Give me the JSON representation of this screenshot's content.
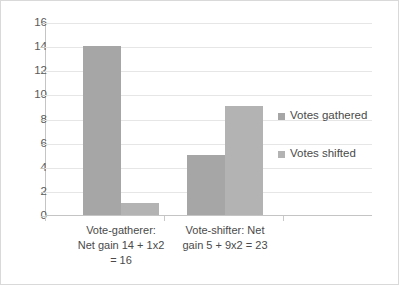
{
  "chart_data": {
    "type": "bar",
    "title": "",
    "subtitle": "",
    "xlabel": "",
    "ylabel": "",
    "ylim": [
      0,
      16
    ],
    "ytick_step": 2,
    "yticks": [
      0,
      2,
      4,
      6,
      8,
      10,
      12,
      14,
      16
    ],
    "grid": true,
    "grid_axis": "y",
    "legend_position": "right",
    "categories": [
      "Vote-gatherer:\nNet gain 14 + 1x2\n= 16",
      "Vote-shifter: Net\ngain 5 + 9x2 = 23"
    ],
    "series": [
      {
        "name": "Votes gathered",
        "values": [
          14,
          5
        ],
        "color": "#a6a6a6"
      },
      {
        "name": "Votes shifted",
        "values": [
          1,
          9
        ],
        "color": "#b3b3b3"
      }
    ]
  },
  "style": {
    "border_color": "#d9d9d9",
    "gridline_color": "#e6e6e6",
    "axis_color": "#c4c4c4",
    "tick_text_color": "#5a5a5a",
    "label_text_color": "#4a4a4a",
    "background": "#ffffff"
  }
}
